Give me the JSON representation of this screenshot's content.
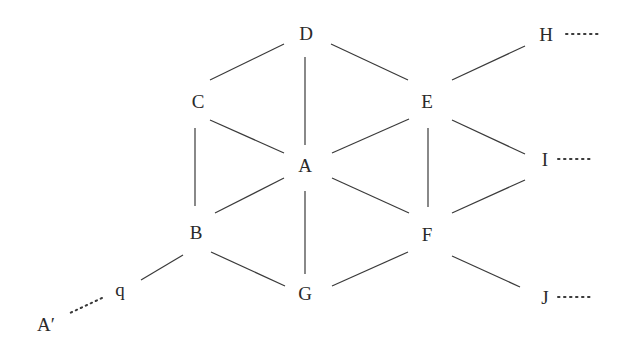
{
  "diagram": {
    "type": "graph",
    "stroke_color": "#3a3a3a",
    "text_color": "#2a2a2a",
    "nodes": [
      {
        "id": "D",
        "label": "D",
        "x": 306,
        "y": 33
      },
      {
        "id": "C",
        "label": "C",
        "x": 198,
        "y": 101
      },
      {
        "id": "E",
        "label": "E",
        "x": 427,
        "y": 101
      },
      {
        "id": "A",
        "label": "A",
        "x": 305,
        "y": 165
      },
      {
        "id": "B",
        "label": "B",
        "x": 196,
        "y": 232
      },
      {
        "id": "F",
        "label": "F",
        "x": 427,
        "y": 234
      },
      {
        "id": "G",
        "label": "G",
        "x": 305,
        "y": 293
      },
      {
        "id": "H",
        "label": "H",
        "x": 546,
        "y": 34
      },
      {
        "id": "I",
        "label": "I",
        "x": 545,
        "y": 159
      },
      {
        "id": "J",
        "label": "J",
        "x": 545,
        "y": 297
      },
      {
        "id": "q",
        "label": "q",
        "x": 120,
        "y": 289
      },
      {
        "id": "Ap",
        "label": "A′",
        "x": 46,
        "y": 324
      }
    ],
    "edges": [
      {
        "from": "D",
        "to": "C",
        "x1": 284,
        "y1": 44,
        "x2": 210,
        "y2": 80,
        "style": "solid"
      },
      {
        "from": "D",
        "to": "E",
        "x1": 331,
        "y1": 44,
        "x2": 408,
        "y2": 80,
        "style": "solid"
      },
      {
        "from": "D",
        "to": "A",
        "x1": 305,
        "y1": 57,
        "x2": 305,
        "y2": 145,
        "style": "solid"
      },
      {
        "from": "C",
        "to": "A",
        "x1": 210,
        "y1": 120,
        "x2": 284,
        "y2": 153,
        "style": "solid"
      },
      {
        "from": "A",
        "to": "E",
        "x1": 332,
        "y1": 153,
        "x2": 409,
        "y2": 119,
        "style": "solid"
      },
      {
        "from": "C",
        "to": "B",
        "x1": 195,
        "y1": 128,
        "x2": 195,
        "y2": 206,
        "style": "solid"
      },
      {
        "from": "E",
        "to": "F",
        "x1": 428,
        "y1": 128,
        "x2": 428,
        "y2": 207,
        "style": "solid"
      },
      {
        "from": "A",
        "to": "B",
        "x1": 284,
        "y1": 178,
        "x2": 215,
        "y2": 213,
        "style": "solid"
      },
      {
        "from": "A",
        "to": "F",
        "x1": 332,
        "y1": 178,
        "x2": 409,
        "y2": 213,
        "style": "solid"
      },
      {
        "from": "A",
        "to": "G",
        "x1": 305,
        "y1": 191,
        "x2": 305,
        "y2": 274,
        "style": "solid"
      },
      {
        "from": "B",
        "to": "G",
        "x1": 211,
        "y1": 252,
        "x2": 285,
        "y2": 286,
        "style": "solid"
      },
      {
        "from": "G",
        "to": "F",
        "x1": 332,
        "y1": 286,
        "x2": 408,
        "y2": 252,
        "style": "solid"
      },
      {
        "from": "B",
        "to": "q",
        "x1": 183,
        "y1": 255,
        "x2": 141,
        "y2": 280,
        "style": "solid"
      },
      {
        "from": "E",
        "to": "H",
        "x1": 452,
        "y1": 80,
        "x2": 525,
        "y2": 46,
        "style": "solid"
      },
      {
        "from": "E",
        "to": "I",
        "x1": 452,
        "y1": 120,
        "x2": 525,
        "y2": 154,
        "style": "solid"
      },
      {
        "from": "F",
        "to": "I",
        "x1": 452,
        "y1": 213,
        "x2": 525,
        "y2": 180,
        "style": "solid"
      },
      {
        "from": "F",
        "to": "J",
        "x1": 452,
        "y1": 256,
        "x2": 520,
        "y2": 287,
        "style": "solid"
      },
      {
        "from": "q",
        "to": "Ap",
        "x1": 102,
        "y1": 298,
        "x2": 70,
        "y2": 313,
        "style": "dotted"
      }
    ],
    "continuations": [
      {
        "after": "H",
        "x1": 566,
        "y1": 34,
        "x2": 602,
        "y2": 34
      },
      {
        "after": "I",
        "x1": 558,
        "y1": 159,
        "x2": 594,
        "y2": 159
      },
      {
        "after": "J",
        "x1": 558,
        "y1": 297,
        "x2": 594,
        "y2": 297
      }
    ]
  }
}
